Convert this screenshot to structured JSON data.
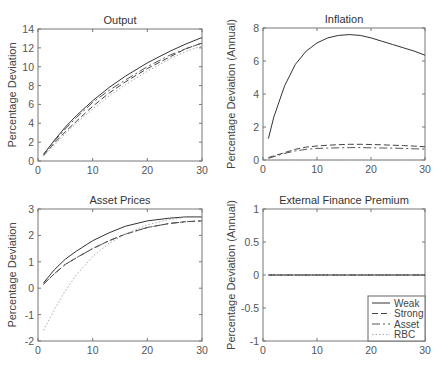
{
  "chart_data": [
    {
      "type": "line",
      "title": "Output",
      "xlabel": "",
      "ylabel": "Percentage Deviation",
      "xlim": [
        0,
        30
      ],
      "ylim": [
        0,
        14
      ],
      "xticks": [
        0,
        10,
        20,
        30
      ],
      "yticks": [
        0,
        2,
        4,
        6,
        8,
        10,
        12,
        14
      ],
      "grid": false,
      "x": [
        1,
        3,
        5,
        7,
        10,
        13,
        16,
        20,
        24,
        27,
        30
      ],
      "series": [
        {
          "name": "Weak",
          "values": [
            0.7,
            2.2,
            3.6,
            4.8,
            6.4,
            7.8,
            9.0,
            10.4,
            11.6,
            12.4,
            13.1
          ]
        },
        {
          "name": "Strong",
          "values": [
            0.6,
            1.9,
            3.1,
            4.2,
            5.8,
            7.2,
            8.4,
            9.8,
            11.0,
            11.9,
            12.5
          ]
        },
        {
          "name": "Asset",
          "values": [
            0.7,
            2.1,
            3.4,
            4.6,
            6.2,
            7.5,
            8.6,
            10.0,
            11.2,
            11.9,
            12.5
          ]
        },
        {
          "name": "RBC",
          "values": [
            0.5,
            1.7,
            2.9,
            4.0,
            5.5,
            6.9,
            8.1,
            9.5,
            10.8,
            11.6,
            12.2
          ]
        }
      ]
    },
    {
      "type": "line",
      "title": "Inflation",
      "xlabel": "",
      "ylabel": "Percentage Deviation (Annual)",
      "xlim": [
        0,
        30
      ],
      "ylim": [
        0,
        8
      ],
      "xticks": [
        0,
        10,
        20,
        30
      ],
      "yticks": [
        0,
        2,
        4,
        6,
        8
      ],
      "grid": false,
      "x": [
        1,
        2,
        4,
        6,
        8,
        10,
        12,
        14,
        16,
        18,
        20,
        22,
        24,
        26,
        28,
        30
      ],
      "series": [
        {
          "name": "Weak",
          "values": [
            1.3,
            2.6,
            4.5,
            5.8,
            6.6,
            7.1,
            7.4,
            7.55,
            7.6,
            7.55,
            7.4,
            7.2,
            7.0,
            6.8,
            6.6,
            6.35
          ]
        },
        {
          "name": "Strong",
          "values": [
            0.15,
            0.25,
            0.45,
            0.65,
            0.78,
            0.85,
            0.9,
            0.93,
            0.95,
            0.95,
            0.94,
            0.92,
            0.9,
            0.87,
            0.84,
            0.8
          ]
        },
        {
          "name": "Asset",
          "values": [
            0.1,
            0.2,
            0.4,
            0.55,
            0.65,
            0.7,
            0.72,
            0.74,
            0.75,
            0.75,
            0.74,
            0.73,
            0.72,
            0.7,
            0.68,
            0.66
          ]
        },
        {
          "name": "RBC",
          "values": [
            0,
            0,
            0,
            0,
            0,
            0,
            0,
            0,
            0,
            0,
            0,
            0,
            0,
            0,
            0,
            0
          ]
        }
      ]
    },
    {
      "type": "line",
      "title": "Asset Prices",
      "xlabel": "",
      "ylabel": "Percentage Deviation",
      "xlim": [
        0,
        30
      ],
      "ylim": [
        -2,
        3
      ],
      "xticks": [
        0,
        10,
        20,
        30
      ],
      "yticks": [
        -2,
        -1,
        0,
        1,
        2,
        3
      ],
      "grid": false,
      "x": [
        1,
        3,
        5,
        7,
        10,
        13,
        16,
        20,
        24,
        27,
        30
      ],
      "series": [
        {
          "name": "Weak",
          "values": [
            0.2,
            0.7,
            1.1,
            1.4,
            1.8,
            2.1,
            2.35,
            2.55,
            2.65,
            2.7,
            2.7
          ]
        },
        {
          "name": "Strong",
          "values": [
            0.15,
            0.55,
            0.9,
            1.15,
            1.5,
            1.8,
            2.05,
            2.3,
            2.45,
            2.52,
            2.55
          ]
        },
        {
          "name": "Asset",
          "values": [
            0.15,
            0.55,
            0.9,
            1.15,
            1.5,
            1.8,
            2.05,
            2.3,
            2.45,
            2.52,
            2.55
          ]
        },
        {
          "name": "RBC",
          "values": [
            -1.6,
            -0.8,
            -0.1,
            0.5,
            1.2,
            1.7,
            2.05,
            2.4,
            2.6,
            2.68,
            2.7
          ]
        }
      ]
    },
    {
      "type": "line",
      "title": "External Finance Premium",
      "xlabel": "",
      "ylabel": "Percentage Deviation (Annual)",
      "xlim": [
        0,
        30
      ],
      "ylim": [
        -1,
        1
      ],
      "xticks": [
        0,
        10,
        20,
        30
      ],
      "yticks": [
        -1,
        -0.5,
        0,
        0.5,
        1
      ],
      "grid": false,
      "legend": {
        "position": "lower right",
        "entries": [
          "Weak",
          "Strong",
          "Asset",
          "RBC"
        ]
      },
      "x": [
        1,
        30
      ],
      "series": [
        {
          "name": "Weak",
          "values": [
            0,
            0
          ]
        },
        {
          "name": "Strong",
          "values": [
            0,
            0
          ]
        },
        {
          "name": "Asset",
          "values": [
            0,
            0
          ]
        },
        {
          "name": "RBC",
          "values": [
            0,
            0
          ]
        }
      ]
    }
  ],
  "legend_labels": [
    "Weak",
    "Strong",
    "Asset",
    "RBC"
  ]
}
